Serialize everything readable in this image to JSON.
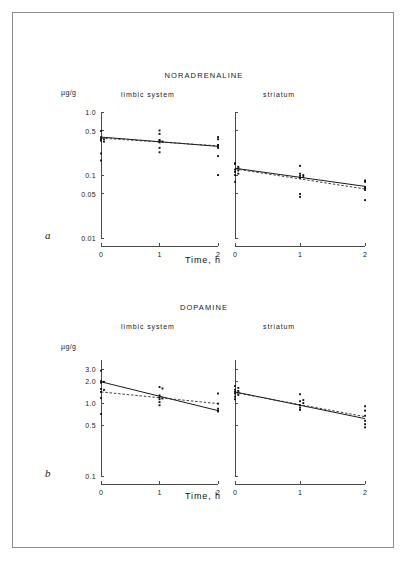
{
  "figure": {
    "panel_a_letter": "a",
    "panel_b_letter": "b",
    "xaxis_title": "Time, h",
    "unit_label": "µg/g",
    "left_group_label": "limbic system",
    "right_group_label": "striatum",
    "xtick_labels": [
      "0",
      "1",
      "2"
    ]
  },
  "chart_data": [
    {
      "type": "scatter",
      "panel": "a",
      "title": "NORADRENALINE",
      "subplot": "limbic system",
      "xlabel": "Time, h",
      "ylabel": "µg/g",
      "yscale": "log",
      "ylim": [
        0.01,
        1.0
      ],
      "ytick_labels": [
        "1.0",
        "0.5",
        "0.1",
        "0.05",
        "0.01"
      ],
      "ytick_values": [
        1.0,
        0.5,
        0.1,
        0.05,
        0.01
      ],
      "xlim": [
        0,
        2
      ],
      "xtick_labels": [
        "0",
        "1",
        "2"
      ],
      "xtick_values": [
        0,
        1,
        2
      ],
      "grid": false,
      "legend": "none",
      "points": [
        {
          "x": 0.0,
          "y": 0.5
        },
        {
          "x": 0.0,
          "y": 0.4
        },
        {
          "x": 0.0,
          "y": 0.38
        },
        {
          "x": 0.0,
          "y": 0.36
        },
        {
          "x": 0.0,
          "y": 0.35
        },
        {
          "x": 0.05,
          "y": 0.37
        },
        {
          "x": 0.05,
          "y": 0.34
        },
        {
          "x": 0.0,
          "y": 0.22
        },
        {
          "x": 0.0,
          "y": 0.17
        },
        {
          "x": 1.0,
          "y": 0.51
        },
        {
          "x": 1.0,
          "y": 0.45
        },
        {
          "x": 1.0,
          "y": 0.36
        },
        {
          "x": 1.0,
          "y": 0.35
        },
        {
          "x": 1.0,
          "y": 0.33
        },
        {
          "x": 1.05,
          "y": 0.34
        },
        {
          "x": 1.0,
          "y": 0.27
        },
        {
          "x": 1.0,
          "y": 0.23
        },
        {
          "x": 2.0,
          "y": 0.4
        },
        {
          "x": 2.0,
          "y": 0.37
        },
        {
          "x": 2.0,
          "y": 0.3
        },
        {
          "x": 2.0,
          "y": 0.29
        },
        {
          "x": 2.0,
          "y": 0.27
        },
        {
          "x": 2.0,
          "y": 0.2
        },
        {
          "x": 2.0,
          "y": 0.1
        }
      ],
      "series": [
        {
          "name": "fit-solid",
          "style": "solid",
          "x": [
            0,
            2
          ],
          "y": [
            0.4,
            0.285
          ]
        },
        {
          "name": "fit-dashed",
          "style": "dashed",
          "x": [
            0,
            2
          ],
          "y": [
            0.385,
            0.29
          ]
        }
      ]
    },
    {
      "type": "scatter",
      "panel": "a",
      "title": "NORADRENALINE",
      "subplot": "striatum",
      "xlabel": "Time, h",
      "yscale": "log",
      "ylim": [
        0.01,
        1.0
      ],
      "ytick_values": [
        1.0,
        0.5,
        0.1,
        0.05,
        0.01
      ],
      "xlim": [
        0,
        2
      ],
      "xtick_labels": [
        "0",
        "1",
        "2"
      ],
      "xtick_values": [
        0,
        1,
        2
      ],
      "grid": false,
      "legend": "none",
      "points": [
        {
          "x": 0.0,
          "y": 0.155
        },
        {
          "x": 0.0,
          "y": 0.15
        },
        {
          "x": 0.05,
          "y": 0.135
        },
        {
          "x": 0.05,
          "y": 0.128
        },
        {
          "x": 0.0,
          "y": 0.122
        },
        {
          "x": 0.05,
          "y": 0.118
        },
        {
          "x": 0.0,
          "y": 0.112
        },
        {
          "x": 0.05,
          "y": 0.105
        },
        {
          "x": 0.0,
          "y": 0.1
        },
        {
          "x": 0.0,
          "y": 0.078
        },
        {
          "x": 1.0,
          "y": 0.14
        },
        {
          "x": 1.0,
          "y": 0.105
        },
        {
          "x": 1.05,
          "y": 0.1
        },
        {
          "x": 1.0,
          "y": 0.097
        },
        {
          "x": 1.05,
          "y": 0.093
        },
        {
          "x": 1.0,
          "y": 0.09
        },
        {
          "x": 1.0,
          "y": 0.05
        },
        {
          "x": 1.0,
          "y": 0.045
        },
        {
          "x": 2.0,
          "y": 0.082
        },
        {
          "x": 2.0,
          "y": 0.078
        },
        {
          "x": 2.0,
          "y": 0.065
        },
        {
          "x": 2.0,
          "y": 0.062
        },
        {
          "x": 2.0,
          "y": 0.058
        },
        {
          "x": 2.0,
          "y": 0.04
        }
      ],
      "series": [
        {
          "name": "fit-solid",
          "style": "solid",
          "x": [
            0,
            2
          ],
          "y": [
            0.128,
            0.066
          ]
        },
        {
          "name": "fit-dashed",
          "style": "dashed",
          "x": [
            0,
            2
          ],
          "y": [
            0.125,
            0.06
          ]
        }
      ]
    },
    {
      "type": "scatter",
      "panel": "b",
      "title": "DOPAMINE",
      "subplot": "limbic system",
      "xlabel": "Time, h",
      "ylabel": "µg/g",
      "yscale": "log",
      "ylim": [
        0.1,
        4.0
      ],
      "ytick_labels": [
        "3.0",
        "2.0",
        "1.0",
        "0.5",
        "0.1"
      ],
      "ytick_values": [
        3.0,
        2.0,
        1.0,
        0.5,
        0.1
      ],
      "xlim": [
        0,
        2
      ],
      "xtick_labels": [
        "0",
        "1",
        "2"
      ],
      "xtick_values": [
        0,
        1,
        2
      ],
      "grid": false,
      "legend": "none",
      "points": [
        {
          "x": 0.0,
          "y": 2.85
        },
        {
          "x": 0.0,
          "y": 2.05
        },
        {
          "x": 0.05,
          "y": 2.0
        },
        {
          "x": 0.0,
          "y": 1.95
        },
        {
          "x": 0.0,
          "y": 1.6
        },
        {
          "x": 0.05,
          "y": 1.55
        },
        {
          "x": 0.0,
          "y": 1.45
        },
        {
          "x": 0.0,
          "y": 1.2
        },
        {
          "x": 0.0,
          "y": 0.72
        },
        {
          "x": 1.0,
          "y": 1.7
        },
        {
          "x": 1.05,
          "y": 1.62
        },
        {
          "x": 1.0,
          "y": 1.3
        },
        {
          "x": 1.0,
          "y": 1.22
        },
        {
          "x": 1.05,
          "y": 1.18
        },
        {
          "x": 1.0,
          "y": 1.15
        },
        {
          "x": 1.0,
          "y": 1.05
        },
        {
          "x": 1.0,
          "y": 0.95
        },
        {
          "x": 2.0,
          "y": 1.38
        },
        {
          "x": 2.0,
          "y": 1.0
        },
        {
          "x": 2.0,
          "y": 0.85
        },
        {
          "x": 2.0,
          "y": 0.8
        },
        {
          "x": 2.0,
          "y": 0.78
        }
      ],
      "series": [
        {
          "name": "fit-solid",
          "style": "solid",
          "x": [
            0,
            2
          ],
          "y": [
            2.0,
            0.8
          ]
        },
        {
          "name": "fit-dashed",
          "style": "dashed",
          "x": [
            0,
            2
          ],
          "y": [
            1.45,
            1.0
          ]
        }
      ]
    },
    {
      "type": "scatter",
      "panel": "b",
      "title": "DOPAMINE",
      "subplot": "striatum",
      "xlabel": "Time, h",
      "yscale": "log",
      "ylim": [
        0.1,
        4.0
      ],
      "ytick_values": [
        3.0,
        2.0,
        1.0,
        0.5,
        0.1
      ],
      "xlim": [
        0,
        2
      ],
      "xtick_labels": [
        "0",
        "1",
        "2"
      ],
      "xtick_values": [
        0,
        1,
        2
      ],
      "grid": false,
      "legend": "none",
      "points": [
        {
          "x": 0.0,
          "y": 1.75
        },
        {
          "x": 0.05,
          "y": 1.65
        },
        {
          "x": 0.0,
          "y": 1.55
        },
        {
          "x": 0.05,
          "y": 1.5
        },
        {
          "x": 0.0,
          "y": 1.45
        },
        {
          "x": 0.05,
          "y": 1.42
        },
        {
          "x": 0.0,
          "y": 1.38
        },
        {
          "x": 0.05,
          "y": 1.32
        },
        {
          "x": 0.0,
          "y": 1.25
        },
        {
          "x": 0.0,
          "y": 1.15
        },
        {
          "x": 1.0,
          "y": 1.35
        },
        {
          "x": 1.05,
          "y": 1.12
        },
        {
          "x": 1.0,
          "y": 1.08
        },
        {
          "x": 1.05,
          "y": 1.02
        },
        {
          "x": 1.0,
          "y": 0.95
        },
        {
          "x": 1.0,
          "y": 0.88
        },
        {
          "x": 1.0,
          "y": 0.82
        },
        {
          "x": 2.0,
          "y": 0.92
        },
        {
          "x": 2.0,
          "y": 0.8
        },
        {
          "x": 2.0,
          "y": 0.68
        },
        {
          "x": 2.0,
          "y": 0.58
        },
        {
          "x": 2.0,
          "y": 0.52
        },
        {
          "x": 2.0,
          "y": 0.47
        }
      ],
      "series": [
        {
          "name": "fit-solid",
          "style": "solid",
          "x": [
            0,
            2
          ],
          "y": [
            1.45,
            0.62
          ]
        },
        {
          "name": "fit-dashed",
          "style": "dashed",
          "x": [
            0,
            2
          ],
          "y": [
            1.42,
            0.66
          ]
        }
      ]
    }
  ]
}
